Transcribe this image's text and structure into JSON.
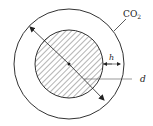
{
  "diagram": {
    "labels": {
      "gas": "CO",
      "gas_sub": "2",
      "thickness": "h",
      "diameter": "d"
    },
    "colors": {
      "stroke": "#333333",
      "hatch": "#444444",
      "background": "#ffffff"
    }
  }
}
